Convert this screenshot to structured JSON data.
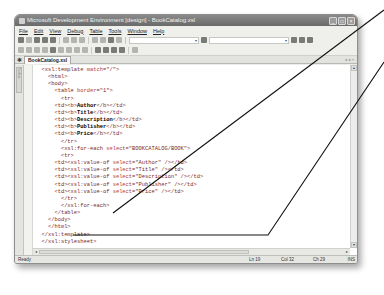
{
  "window": {
    "title": "Microsoft Development Environment [design] - BookCatalog.xsl",
    "controls": [
      "minimize",
      "maximize",
      "close"
    ]
  },
  "menubar": {
    "items": [
      "File",
      "Edit",
      "View",
      "Debug",
      "Table",
      "Tools",
      "Window",
      "Help"
    ]
  },
  "toolbar": {
    "combo_dropdown_label": "▾"
  },
  "document_tabs": {
    "active_tab": "BookCatalog.xsl",
    "nav": "◂ ▸ ×"
  },
  "sidebar": {
    "toolbox_label": "Toolbox"
  },
  "editor": {
    "lines": [
      {
        "indent": "",
        "parts": [
          {
            "t": "tag",
            "v": "<xsl:template "
          },
          {
            "t": "attr",
            "v": "match"
          },
          {
            "t": "tag",
            "v": "=\"/\">"
          }
        ]
      },
      {
        "indent": "  ",
        "parts": [
          {
            "t": "tag",
            "v": "<html>"
          }
        ]
      },
      {
        "indent": "  ",
        "parts": [
          {
            "t": "tag",
            "v": "<body>"
          }
        ]
      },
      {
        "indent": "    ",
        "parts": [
          {
            "t": "tag",
            "v": "<table "
          },
          {
            "t": "attr",
            "v": "border"
          },
          {
            "t": "tag",
            "v": "=\"1\">"
          }
        ]
      },
      {
        "indent": "      ",
        "parts": [
          {
            "t": "tag",
            "v": "<tr>"
          }
        ]
      },
      {
        "indent": "    ",
        "parts": [
          {
            "t": "tag",
            "v": "<td><b>"
          },
          {
            "t": "txt",
            "v": "Author"
          },
          {
            "t": "tag",
            "v": "</b></td>"
          }
        ]
      },
      {
        "indent": "    ",
        "parts": [
          {
            "t": "tag",
            "v": "<td><b>"
          },
          {
            "t": "txt",
            "v": "Title"
          },
          {
            "t": "tag",
            "v": "</b></td>"
          }
        ]
      },
      {
        "indent": "    ",
        "parts": [
          {
            "t": "tag",
            "v": "<td><b>"
          },
          {
            "t": "txt",
            "v": "Description"
          },
          {
            "t": "tag",
            "v": "</b></td>"
          }
        ]
      },
      {
        "indent": "    ",
        "parts": [
          {
            "t": "tag",
            "v": "<td><b>"
          },
          {
            "t": "txt",
            "v": "Publisher"
          },
          {
            "t": "tag",
            "v": "</b></td>"
          }
        ]
      },
      {
        "indent": "    ",
        "parts": [
          {
            "t": "tag",
            "v": "<td><b>"
          },
          {
            "t": "txt",
            "v": "Price"
          },
          {
            "t": "tag",
            "v": "</b></td>"
          }
        ]
      },
      {
        "indent": "      ",
        "parts": [
          {
            "t": "tag",
            "v": "</tr>"
          }
        ]
      },
      {
        "indent": "      ",
        "parts": [
          {
            "t": "tag",
            "v": "<xsl:for-each "
          },
          {
            "t": "attr",
            "v": "select"
          },
          {
            "t": "tag",
            "v": "=\"BOOKCATALOG/BOOK\">"
          }
        ]
      },
      {
        "indent": "      ",
        "parts": [
          {
            "t": "tag",
            "v": "<tr>"
          }
        ]
      },
      {
        "indent": "    ",
        "parts": [
          {
            "t": "tag",
            "v": "<td><xsl:value-of "
          },
          {
            "t": "attr",
            "v": "select"
          },
          {
            "t": "tag",
            "v": "=\"Author\" /></td>"
          }
        ]
      },
      {
        "indent": "    ",
        "parts": [
          {
            "t": "tag",
            "v": "<td><xsl:value-of "
          },
          {
            "t": "attr",
            "v": "select"
          },
          {
            "t": "tag",
            "v": "=\"Title\" /></td>"
          }
        ]
      },
      {
        "indent": "    ",
        "parts": [
          {
            "t": "tag",
            "v": "<td><xsl:value-of "
          },
          {
            "t": "attr",
            "v": "select"
          },
          {
            "t": "tag",
            "v": "=\"Description\" /></td>"
          }
        ]
      },
      {
        "indent": "    ",
        "parts": [
          {
            "t": "tag",
            "v": "<td><xsl:value-of "
          },
          {
            "t": "attr",
            "v": "select"
          },
          {
            "t": "tag",
            "v": "=\"Publisher\" /></td>"
          }
        ]
      },
      {
        "indent": "    ",
        "parts": [
          {
            "t": "tag",
            "v": "<td><xsl:value-of "
          },
          {
            "t": "attr",
            "v": "select"
          },
          {
            "t": "tag",
            "v": "=\"Price\" /></td>"
          }
        ]
      },
      {
        "indent": "      ",
        "parts": [
          {
            "t": "tag",
            "v": "</tr>"
          }
        ]
      },
      {
        "indent": "      ",
        "parts": [
          {
            "t": "tag",
            "v": "</xsl:for-each>"
          }
        ]
      },
      {
        "indent": "    ",
        "parts": [
          {
            "t": "tag",
            "v": "</table>"
          }
        ]
      },
      {
        "indent": "  ",
        "parts": [
          {
            "t": "tag",
            "v": "</body>"
          }
        ]
      },
      {
        "indent": "  ",
        "parts": [
          {
            "t": "tag",
            "v": "</html>"
          }
        ]
      },
      {
        "indent": "",
        "parts": [
          {
            "t": "tag",
            "v": "</xsl:template>"
          }
        ]
      },
      {
        "indent": "",
        "parts": [
          {
            "t": "tag",
            "v": "</xsl:stylesheet>"
          }
        ]
      }
    ]
  },
  "statusbar": {
    "status": "Ready",
    "line": "Ln 19",
    "col": "Col 32",
    "ch": "Ch 29",
    "mode": "INS"
  },
  "colors": {
    "tag": "#7a2a2a",
    "attribute": "#b04040",
    "text": "#000000",
    "callout_line": "#111111"
  }
}
